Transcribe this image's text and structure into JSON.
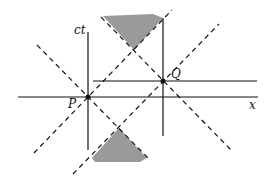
{
  "diagram": {
    "axes": {
      "x_label": "x",
      "t_label": "ct"
    },
    "events": [
      {
        "name": "P",
        "x": 88,
        "y": 97
      },
      {
        "name": "Q",
        "x": 163,
        "y": 81
      }
    ],
    "colors": {
      "line": "#111111",
      "shade": "#9a9a9a",
      "background": "#ffffff"
    }
  }
}
